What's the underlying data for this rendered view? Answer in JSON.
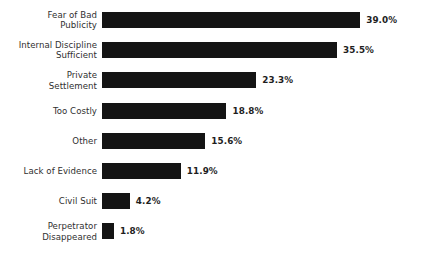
{
  "chart_data": {
    "type": "bar",
    "orientation": "horizontal",
    "title": "",
    "subtitle": "",
    "xlabel": "",
    "ylabel": "",
    "grid": false,
    "legend": null,
    "axis_visible": false,
    "value_suffix": "%",
    "xlim": [
      0,
      39.0
    ],
    "bar_color": "#141414",
    "background_color": "#ffffff",
    "label_color": "#2f2f2f",
    "value_color": "#1e1e1e",
    "categories": [
      "Fear of Bad\nPublicity",
      "Internal Discipline\nSufficient",
      "Private\nSettlement",
      "Too Costly",
      "Other",
      "Lack of Evidence",
      "Civil Suit",
      "Perpetrator\nDisappeared"
    ],
    "values": [
      39.0,
      35.5,
      23.3,
      18.8,
      15.6,
      11.9,
      4.2,
      1.8
    ],
    "value_labels": [
      "39.0%",
      "35.5%",
      "23.3%",
      "18.8%",
      "15.6%",
      "11.9%",
      "4.2%",
      "1.8%"
    ],
    "bars": [
      {
        "category": "Fear of Bad\nPublicity",
        "value": 39.0,
        "value_label": "39.0%",
        "lines": 2
      },
      {
        "category": "Internal Discipline\nSufficient",
        "value": 35.5,
        "value_label": "35.5%",
        "lines": 2
      },
      {
        "category": "Private\nSettlement",
        "value": 23.3,
        "value_label": "23.3%",
        "lines": 2
      },
      {
        "category": "Too Costly",
        "value": 18.8,
        "value_label": "18.8%",
        "lines": 1
      },
      {
        "category": "Other",
        "value": 15.6,
        "value_label": "15.6%",
        "lines": 1
      },
      {
        "category": "Lack of Evidence",
        "value": 11.9,
        "value_label": "11.9%",
        "lines": 1
      },
      {
        "category": "Civil Suit",
        "value": 4.2,
        "value_label": "4.2%",
        "lines": 1
      },
      {
        "category": "Perpetrator\nDisappeared",
        "value": 1.8,
        "value_label": "1.8%",
        "lines": 2
      }
    ]
  },
  "layout": {
    "axis_left_px": 102,
    "px_per_unit": 6.62,
    "row_pitch_px": 30.2,
    "first_row_top_px": 12,
    "bar_height_px": 16,
    "value_gap_px": 6
  }
}
